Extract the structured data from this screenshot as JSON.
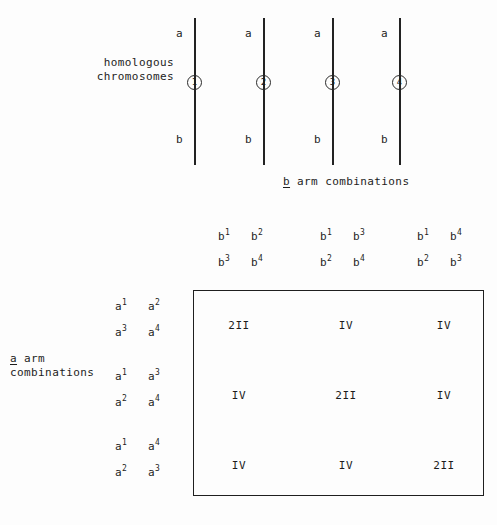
{
  "labels": {
    "homologous_chromosomes_line1": "homologous",
    "homologous_chromosomes_line2": "chromosomes",
    "b_arm_underlined": "b",
    "b_arm_rest": " arm combinations",
    "a_arm_underlined": "a",
    "a_arm_rest": " arm",
    "a_arm_line2": "combinations"
  },
  "chromosomes": [
    {
      "number": "1",
      "top_arm": "a",
      "bottom_arm": "b"
    },
    {
      "number": "2",
      "top_arm": "a",
      "bottom_arm": "b"
    },
    {
      "number": "3",
      "top_arm": "a",
      "bottom_arm": "b"
    },
    {
      "number": "4",
      "top_arm": "a",
      "bottom_arm": "b"
    }
  ],
  "b_column_headers": [
    {
      "top_left": {
        "base": "b",
        "sup": "1"
      },
      "top_right": {
        "base": "b",
        "sup": "2"
      },
      "bottom_left": {
        "base": "b",
        "sup": "3"
      },
      "bottom_right": {
        "base": "b",
        "sup": "4"
      }
    },
    {
      "top_left": {
        "base": "b",
        "sup": "1"
      },
      "top_right": {
        "base": "b",
        "sup": "3"
      },
      "bottom_left": {
        "base": "b",
        "sup": "2"
      },
      "bottom_right": {
        "base": "b",
        "sup": "4"
      }
    },
    {
      "top_left": {
        "base": "b",
        "sup": "1"
      },
      "top_right": {
        "base": "b",
        "sup": "4"
      },
      "bottom_left": {
        "base": "b",
        "sup": "2"
      },
      "bottom_right": {
        "base": "b",
        "sup": "3"
      }
    }
  ],
  "a_row_headers": [
    {
      "top_left": {
        "base": "a",
        "sup": "1"
      },
      "top_right": {
        "base": "a",
        "sup": "2"
      },
      "bottom_left": {
        "base": "a",
        "sup": "3"
      },
      "bottom_right": {
        "base": "a",
        "sup": "4"
      }
    },
    {
      "top_left": {
        "base": "a",
        "sup": "1"
      },
      "top_right": {
        "base": "a",
        "sup": "3"
      },
      "bottom_left": {
        "base": "a",
        "sup": "2"
      },
      "bottom_right": {
        "base": "a",
        "sup": "4"
      }
    },
    {
      "top_left": {
        "base": "a",
        "sup": "1"
      },
      "top_right": {
        "base": "a",
        "sup": "4"
      },
      "bottom_left": {
        "base": "a",
        "sup": "2"
      },
      "bottom_right": {
        "base": "a",
        "sup": "3"
      }
    }
  ],
  "matrix": {
    "rows": [
      [
        "2II",
        "IV",
        "IV"
      ],
      [
        "IV",
        "2II",
        "IV"
      ],
      [
        "IV",
        "IV",
        "2II"
      ]
    ]
  },
  "colors": {
    "background": "#fdfdfd",
    "ink": "#1c1c1c",
    "rule": "#1f1f1f"
  }
}
